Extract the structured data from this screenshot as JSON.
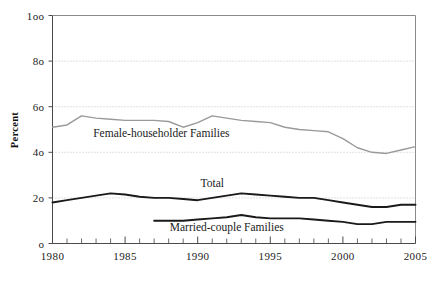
{
  "chart_data": {
    "type": "line",
    "title": "",
    "xlabel": "",
    "ylabel": "Percent",
    "xlim": [
      1980,
      2005
    ],
    "ylim": [
      0,
      100
    ],
    "grid": true,
    "legend_position": "inline-annotations",
    "y_ticks": [
      0,
      20,
      40,
      60,
      80,
      100
    ],
    "y_tick_labels": [
      "o",
      "2o",
      "4o",
      "6o",
      "8o",
      "1oo"
    ],
    "x_ticks": [
      1980,
      1985,
      1990,
      1995,
      2000,
      2005
    ],
    "x_tick_labels": [
      "1980",
      "1985",
      "1990",
      "1995",
      "2000",
      "2005"
    ],
    "x_minor_tick_interval": 1,
    "x": [
      1980,
      1981,
      1982,
      1983,
      1984,
      1985,
      1986,
      1987,
      1988,
      1989,
      1990,
      1991,
      1992,
      1993,
      1994,
      1995,
      1996,
      1997,
      1998,
      1999,
      2000,
      2001,
      2002,
      2003,
      2004,
      2005
    ],
    "series": [
      {
        "name": "Female-householder Families",
        "label": "Female-householder Families",
        "color": "#9a9a9a",
        "width": 1.4,
        "x_start": 1980,
        "values": [
          51,
          52,
          56,
          55,
          54.5,
          54,
          54,
          54,
          53.5,
          51,
          53,
          56,
          55,
          54,
          53.5,
          53,
          51,
          50,
          49.5,
          49,
          46,
          42,
          40,
          39.5,
          41,
          42.5
        ]
      },
      {
        "name": "Total",
        "label": "Total",
        "color": "#1a1a1a",
        "width": 1.9,
        "x_start": 1980,
        "values": [
          18,
          19,
          20,
          21,
          22,
          21.5,
          20.5,
          20,
          20,
          19.5,
          19,
          20,
          21,
          22,
          21.5,
          21,
          20.5,
          20,
          20,
          19,
          18,
          17,
          16,
          16,
          17,
          17
        ]
      },
      {
        "name": "Married-couple Families",
        "label": "Married-couple Families",
        "color": "#1a1a1a",
        "width": 1.9,
        "x_start": 1987,
        "values": [
          null,
          null,
          null,
          null,
          null,
          null,
          null,
          10,
          10,
          10,
          10.5,
          11,
          11.5,
          12.5,
          11.5,
          11,
          11,
          11,
          10.5,
          10,
          9.5,
          8.5,
          8.5,
          9.5,
          9.5,
          9.5
        ]
      }
    ],
    "annotations": [
      {
        "text": "Female-householder Families",
        "x": 1987.5,
        "y": 46.5
      },
      {
        "text": "Total",
        "x": 1991.0,
        "y": 25.0
      },
      {
        "text": "Married-couple Families",
        "x": 1992.0,
        "y": 5.3
      }
    ]
  }
}
